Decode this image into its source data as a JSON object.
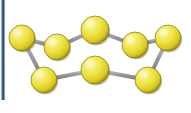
{
  "canvas": {
    "width": 191,
    "height": 113,
    "background_color": "#ffffff"
  },
  "decoration": {
    "left_stripe": {
      "name": "left-edge-blue-stripe",
      "color": "#3a5e90",
      "x": 1,
      "y": 0,
      "width": 4,
      "height": 100
    }
  },
  "diagram": {
    "type": "ball-and-stick molecular model",
    "title": "",
    "shape": "crown / puckered ring",
    "atom_count": 8,
    "bond_count": 8,
    "atom_color": "#ede03c",
    "atom_highlight_color": "#fbf7b8",
    "atom_shadow_color": "#b8a818",
    "atom_rim_color": "#7d7416",
    "bond_color": "#8f9094",
    "bond_highlight_color": "#c6c8cc",
    "bond_width": 4,
    "atom_radius": 13,
    "atoms": [
      {
        "id": "a1",
        "label": "",
        "cx": 22,
        "cy": 38,
        "r": 13
      },
      {
        "id": "a2",
        "label": "",
        "cx": 57,
        "cy": 47,
        "r": 13
      },
      {
        "id": "a3",
        "label": "",
        "cx": 95,
        "cy": 30,
        "r": 14
      },
      {
        "id": "a4",
        "label": "",
        "cx": 135,
        "cy": 45,
        "r": 13
      },
      {
        "id": "a5",
        "label": "",
        "cx": 168,
        "cy": 38,
        "r": 13
      },
      {
        "id": "a6",
        "label": "",
        "cx": 148,
        "cy": 80,
        "r": 13
      },
      {
        "id": "a7",
        "label": "",
        "cx": 95,
        "cy": 70,
        "r": 14
      },
      {
        "id": "a8",
        "label": "",
        "cx": 44,
        "cy": 80,
        "r": 13
      }
    ],
    "bonds": [
      {
        "from": "a1",
        "to": "a2"
      },
      {
        "from": "a2",
        "to": "a3"
      },
      {
        "from": "a3",
        "to": "a4"
      },
      {
        "from": "a4",
        "to": "a5"
      },
      {
        "from": "a5",
        "to": "a6"
      },
      {
        "from": "a6",
        "to": "a7"
      },
      {
        "from": "a7",
        "to": "a8"
      },
      {
        "from": "a8",
        "to": "a1"
      }
    ]
  }
}
